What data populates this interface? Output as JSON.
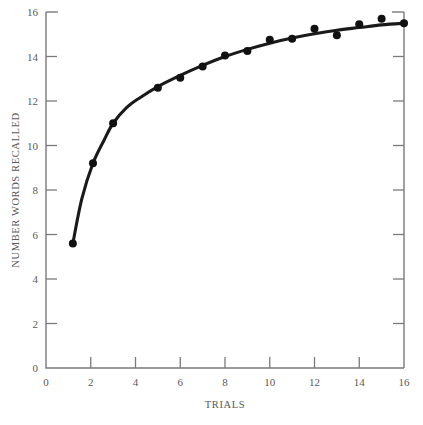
{
  "chart_data": {
    "type": "line",
    "title": "",
    "xlabel": "TRIALS",
    "ylabel": "NUMBER WORDS RECALLED",
    "xlim": [
      0,
      16
    ],
    "ylim": [
      0,
      16
    ],
    "xticks": [
      0,
      2,
      4,
      6,
      8,
      10,
      12,
      14,
      16
    ],
    "yticks": [
      0,
      2,
      4,
      6,
      8,
      10,
      12,
      14,
      16
    ],
    "xtick_labels": [
      "0",
      "2",
      "4",
      "6",
      "8",
      "10",
      "12",
      "14",
      "16"
    ],
    "ytick_labels": [
      "0",
      "2",
      "4",
      "6",
      "8",
      "10",
      "12",
      "14",
      "16"
    ],
    "grid": false,
    "legend": "none",
    "tick_direction": "in",
    "axes_shown": [
      "left",
      "bottom",
      "right"
    ],
    "series": [
      {
        "name": "Number words recalled",
        "marker": "filled-circle",
        "marker_color": "#111111",
        "line_color": "#1a1a1a",
        "x": [
          1.2,
          2.1,
          3.0,
          5.0,
          6.0,
          7.0,
          8.0,
          9.0,
          10.0,
          11.0,
          12.0,
          13.0,
          14.0,
          15.0,
          16.0
        ],
        "values": [
          5.6,
          9.2,
          11.0,
          12.6,
          13.05,
          13.55,
          14.05,
          14.25,
          14.75,
          14.8,
          15.25,
          14.95,
          15.45,
          15.7,
          15.5
        ]
      }
    ],
    "fitted_curve": {
      "description": "smooth negatively accelerated learning curve through the points",
      "x": [
        1.2,
        1.6,
        2.1,
        2.6,
        3.0,
        3.6,
        4.2,
        5.0,
        6.0,
        7.0,
        8.0,
        9.0,
        10.0,
        11.0,
        12.0,
        13.0,
        14.0,
        15.0,
        16.1
      ],
      "y": [
        5.6,
        7.6,
        9.2,
        10.25,
        11.0,
        11.7,
        12.15,
        12.65,
        13.15,
        13.6,
        14.0,
        14.32,
        14.6,
        14.83,
        15.02,
        15.18,
        15.3,
        15.42,
        15.5
      ]
    }
  },
  "figure": {
    "background_color": "#ffffff",
    "axis_color": "#7a7a7a",
    "data_color": "#111111"
  }
}
